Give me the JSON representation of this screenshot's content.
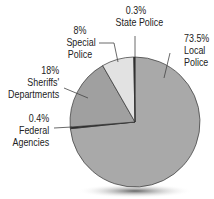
{
  "chart_data": {
    "type": "pie",
    "title": "",
    "slices": [
      {
        "label": "Local Police",
        "value": 73.5,
        "display": "73.5%",
        "color": "#a9a9a9"
      },
      {
        "label": "Federal Agencies",
        "value": 0.4,
        "display": "0.4%",
        "color": "#2a2a2a"
      },
      {
        "label": "Sheriffs' Departments",
        "value": 18,
        "display": "18%",
        "color": "#a0a0a0"
      },
      {
        "label": "Special Police",
        "value": 8,
        "display": "8%",
        "color": "#e2e2e2"
      },
      {
        "label": "State Police",
        "value": 0.3,
        "display": "0.3%",
        "color": "#2a2a2a"
      }
    ],
    "start_angle_deg": 0,
    "direction": "clockwise",
    "legend": "none (direct labels with leader lines)"
  },
  "labels": {
    "local": {
      "pct": "73.5%",
      "line1": "Local",
      "line2": "Police"
    },
    "federal": {
      "pct": "0.4%",
      "line1": "Federal",
      "line2": "Agencies"
    },
    "sheriffs": {
      "pct": "18%",
      "line1": "Sheriffs'",
      "line2": "Departments"
    },
    "special": {
      "pct": "8%",
      "line1": "Special",
      "line2": "Police"
    },
    "state": {
      "pct": "0.3%",
      "line1": "State Police"
    }
  }
}
